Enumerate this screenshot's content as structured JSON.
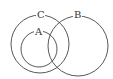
{
  "diagram": {
    "type": "venn",
    "stroke_color": "#444444",
    "background": "#ffffff",
    "sets": [
      {
        "label": "C",
        "cx": 40,
        "cy": 44,
        "r": 29,
        "label_x": 37,
        "label_y": 18
      },
      {
        "label": "A",
        "cx": 39,
        "cy": 49,
        "r": 18,
        "label_x": 35,
        "label_y": 35
      },
      {
        "label": "B",
        "cx": 78,
        "cy": 46,
        "r": 30,
        "label_x": 74,
        "label_y": 18
      }
    ]
  }
}
